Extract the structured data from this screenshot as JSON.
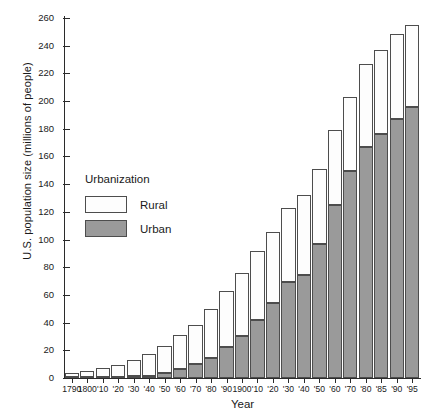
{
  "chart_data": {
    "type": "bar",
    "subtype": "stacked-vertical",
    "title": "",
    "xlabel": "Year",
    "ylabel": "U.S. population size (millions of people)",
    "ylim": [
      0,
      260
    ],
    "ytick_step": 20,
    "ytick_labels": [
      "0",
      "20",
      "40",
      "60",
      "80",
      "100",
      "120",
      "140",
      "160",
      "180",
      "200",
      "220",
      "240",
      "260"
    ],
    "grid": false,
    "legend": {
      "title": "Urbanization",
      "position": "inside-upper-left",
      "entries": [
        {
          "name": "Rural",
          "color": "#fdfdfd"
        },
        {
          "name": "Urban",
          "color": "#9a9a9a"
        }
      ]
    },
    "categories": [
      "1790",
      "1800",
      "'10",
      "'20",
      "'30",
      "'40",
      "'50",
      "'60",
      "'70",
      "'80",
      "'90",
      "1900",
      "'10",
      "'20",
      "'30",
      "'40",
      "'50",
      "'60",
      "'70",
      "'80",
      "'85",
      "'90",
      "'95"
    ],
    "series": [
      {
        "name": "Urban",
        "color": "#9a9a9a",
        "values": [
          0.2,
          0.3,
          0.5,
          0.7,
          1.1,
          1.8,
          3.5,
          6.2,
          9.9,
          14.1,
          22.1,
          30.2,
          42.0,
          54.2,
          69.0,
          74.7,
          96.5,
          125.3,
          149.6,
          167.1,
          176.0,
          187.1,
          196.0
        ]
      },
      {
        "name": "Rural",
        "color": "#fdfdfd",
        "values": [
          3.7,
          5.0,
          6.7,
          8.9,
          11.7,
          15.2,
          19.6,
          25.2,
          28.7,
          36.0,
          40.8,
          45.8,
          50.0,
          51.6,
          53.8,
          57.2,
          54.5,
          54.1,
          53.6,
          59.5,
          61.0,
          61.6,
          59.0
        ]
      }
    ],
    "totals": [
      3.9,
      5.3,
      7.2,
      9.6,
      12.9,
      17.1,
      23.2,
      31.4,
      38.6,
      50.2,
      62.9,
      76.0,
      92.0,
      105.7,
      122.8,
      131.7,
      151.3,
      179.3,
      203.2,
      226.5,
      237.0,
      248.7,
      255.0
    ]
  },
  "layout": {
    "axis_color": "#2b2b2b",
    "bar_border_color": "#4d4d4d"
  }
}
